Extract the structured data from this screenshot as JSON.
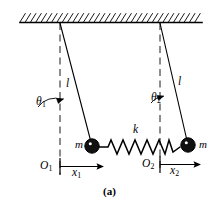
{
  "figure": {
    "caption": "(a)",
    "colors": {
      "ink": "#000000",
      "background": "#ffffff"
    }
  },
  "labels": {
    "theta1": {
      "symbol": "θ",
      "subscript": "1"
    },
    "theta2": {
      "symbol": "θ",
      "subscript": "2"
    },
    "length_left": {
      "symbol": "l"
    },
    "length_right": {
      "symbol": "l"
    },
    "mass_left": {
      "symbol": "m"
    },
    "mass_right": {
      "symbol": "m"
    },
    "spring_constant": {
      "symbol": "k"
    },
    "origin_left": {
      "symbol": "O",
      "subscript": "1"
    },
    "origin_right": {
      "symbol": "O",
      "subscript": "2"
    },
    "displacement_left": {
      "symbol": "x",
      "subscript": "1"
    },
    "displacement_right": {
      "symbol": "x",
      "subscript": "2"
    }
  },
  "geometry": {
    "ceiling": {
      "x_start": 20,
      "x_end": 202,
      "y": 22,
      "hatch_count": 34
    },
    "pivot_left": {
      "x": 60,
      "y": 23
    },
    "pivot_right": {
      "x": 160,
      "y": 23
    },
    "bob_left": {
      "x": 92,
      "y": 146,
      "radius": 7
    },
    "bob_right": {
      "x": 188,
      "y": 145,
      "radius": 7
    },
    "dashed_left": {
      "x": 60,
      "y_start": 23,
      "y_end": 174
    },
    "dashed_right": {
      "x": 160,
      "y_start": 23,
      "y_end": 172
    },
    "spring": {
      "x_start": 100,
      "x_end": 180,
      "y": 147,
      "coils": 7
    },
    "axis_left": {
      "x_start": 60,
      "x_end": 103,
      "y": 166
    },
    "axis_right": {
      "x_start": 160,
      "x_end": 200,
      "y": 164
    }
  }
}
